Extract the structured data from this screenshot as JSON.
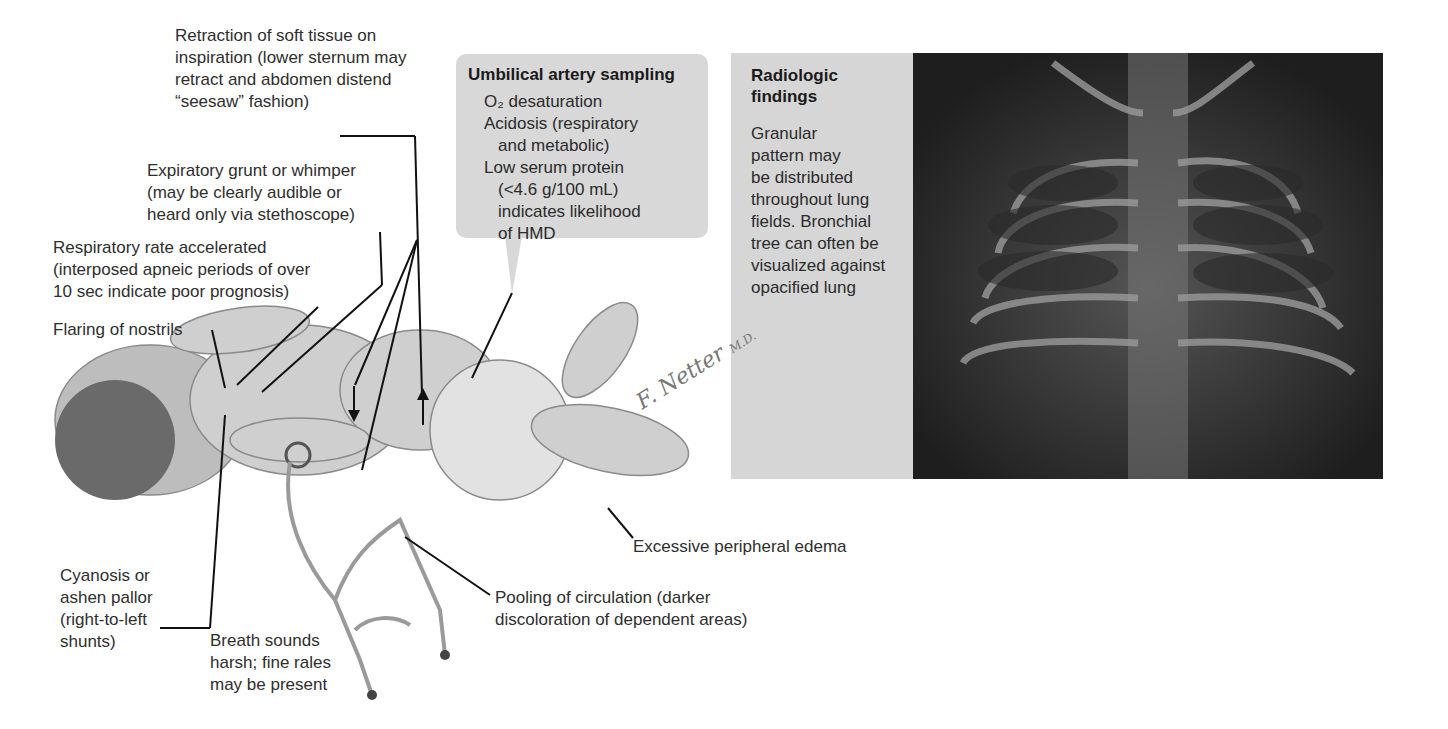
{
  "figure": {
    "labels": {
      "retraction": [
        "Retraction of soft tissue on",
        "inspiration (lower sternum may",
        "retract and abdomen distend",
        "“seesaw” fashion)"
      ],
      "grunt": [
        "Expiratory grunt or whimper",
        "(may be clearly audible or",
        "heard only via stethoscope)"
      ],
      "resp_rate": [
        "Respiratory rate accelerated",
        "(interposed apneic periods of over",
        "10 sec indicate poor prognosis)"
      ],
      "nostrils": [
        "Flaring of nostrils"
      ],
      "cyanosis": [
        "Cyanosis or",
        "ashen pallor",
        "(right-to-left",
        "shunts)"
      ],
      "breath_sounds": [
        "Breath sounds",
        "harsh; fine rales",
        "may be present"
      ],
      "pooling": [
        "Pooling of circulation (darker",
        "discoloration of dependent areas)"
      ],
      "edema": [
        "Excessive peripheral edema"
      ]
    },
    "umbilical_box": {
      "title": "Umbilical artery sampling",
      "lines": [
        {
          "text": "O₂ desaturation",
          "indent": false
        },
        {
          "text": "Acidosis (respiratory",
          "indent": false
        },
        {
          "text": "and metabolic)",
          "indent": true
        },
        {
          "text": "Low serum protein",
          "indent": false
        },
        {
          "text": "(<4.6 g/100 mL)",
          "indent": true
        },
        {
          "text": "indicates likelihood",
          "indent": true
        },
        {
          "text": "of HMD",
          "indent": true
        }
      ]
    },
    "radiologic_box": {
      "title_lines": [
        "Radiologic",
        "findings"
      ],
      "lines": [
        "Granular",
        "pattern may",
        "be distributed",
        "throughout lung",
        "fields. Bronchial",
        "tree can often be",
        "visualized against",
        "opacified lung"
      ]
    },
    "signature": {
      "name": "F. Netter",
      "suffix": "M.D."
    },
    "colors": {
      "callout_box": "#d8d8d8",
      "xray_bg": "#1f1f1f",
      "text": "#2e2e2e"
    }
  }
}
